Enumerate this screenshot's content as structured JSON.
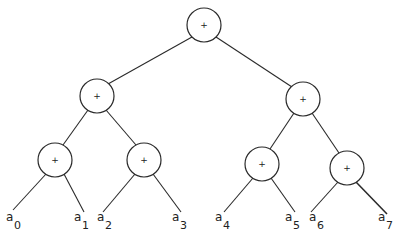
{
  "diagram": {
    "type": "binary-reduction-tree",
    "operator": "+",
    "nodes": [
      {
        "id": "root",
        "label": "+",
        "x": 204,
        "y": 25
      },
      {
        "id": "l1a",
        "label": "+",
        "x": 97,
        "y": 96
      },
      {
        "id": "l1b",
        "label": "+",
        "x": 303,
        "y": 99
      },
      {
        "id": "l2a",
        "label": "+",
        "x": 55,
        "y": 160
      },
      {
        "id": "l2b",
        "label": "+",
        "x": 144,
        "y": 160
      },
      {
        "id": "l2c",
        "label": "+",
        "x": 262,
        "y": 164
      },
      {
        "id": "l2d",
        "label": "+",
        "x": 347,
        "y": 168
      }
    ],
    "leaves": [
      {
        "base": "a",
        "sub": "0"
      },
      {
        "base": "a",
        "sub": "1"
      },
      {
        "base": "a",
        "sub": "2"
      },
      {
        "base": "a",
        "sub": "3"
      },
      {
        "base": "a",
        "sub": "4"
      },
      {
        "base": "a",
        "sub": "5"
      },
      {
        "base": "a",
        "sub": "6"
      },
      {
        "base": "a",
        "sub": "7"
      }
    ]
  }
}
